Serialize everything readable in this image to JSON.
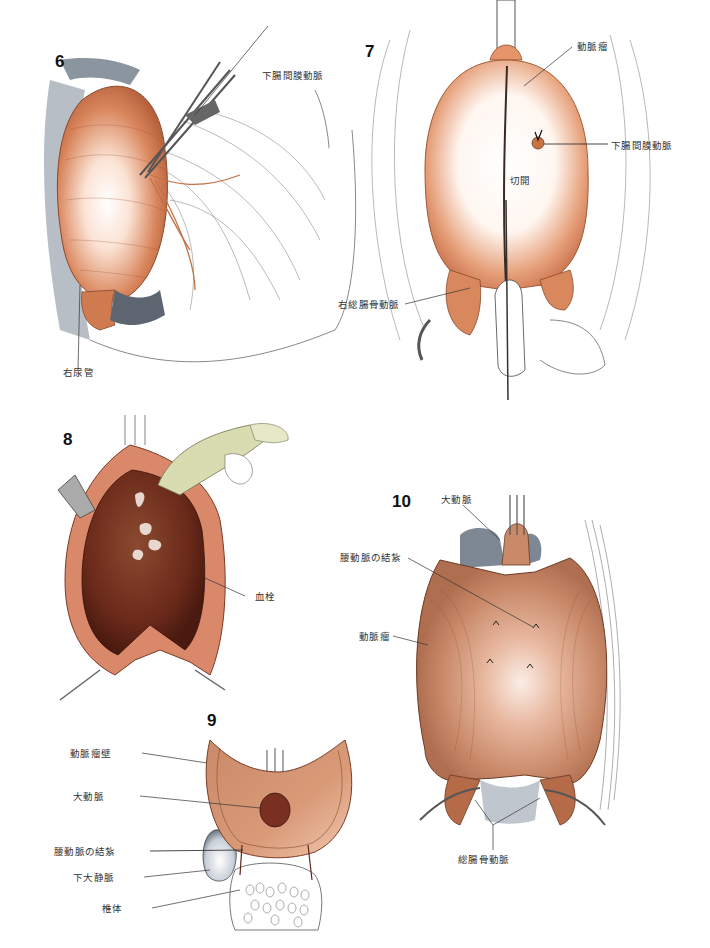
{
  "figures": [
    {
      "number": "6",
      "labels": {
        "inferior_mesenteric_artery": "下腸間膜動脈",
        "right_ureter": "右尿管"
      }
    },
    {
      "number": "7",
      "labels": {
        "aneurysm": "動脈瘤",
        "inferior_mesenteric_artery": "下腸間膜動脈",
        "incision": "切開",
        "right_common_iliac_artery": "右総腸骨動脈"
      }
    },
    {
      "number": "8",
      "labels": {
        "thrombus": "血栓"
      }
    },
    {
      "number": "9",
      "labels": {
        "aneurysm_wall": "動脈瘤壁",
        "aorta": "大動脈",
        "lumbar_artery_ligation": "腰動脈の結紮",
        "inferior_vena_cava": "下大静脈",
        "vertebral_body": "椎体"
      }
    },
    {
      "number": "10",
      "labels": {
        "aorta": "大動脈",
        "lumbar_artery_ligation": "腰動脈の結紮",
        "aneurysm": "動脈瘤",
        "common_iliac_arteries": "総腸骨動脈"
      }
    }
  ],
  "colors": {
    "aneurysm_orange": "#d98055",
    "aneurysm_highlight": "#fbe6da",
    "thrombus_brown": "#6b2a1a",
    "tissue_tan": "#c98a6a",
    "vein_gray": "#7d8894",
    "glove_green": "#d8dcb0",
    "line": "#333333"
  }
}
